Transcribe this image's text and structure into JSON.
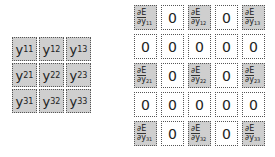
{
  "left_matrix": {
    "label": "Y",
    "cells": [
      [
        "y",
        "11"
      ],
      [
        "y",
        "12"
      ],
      [
        "y",
        "13"
      ],
      [
        "y",
        "21"
      ],
      [
        "y",
        "22"
      ],
      [
        "y",
        "23"
      ],
      [
        "y",
        "31"
      ],
      [
        "y",
        "32"
      ],
      [
        "y",
        "33"
      ]
    ]
  },
  "right_matrix": {
    "numerator": "∂E",
    "denominator": "∂y",
    "zero": "0",
    "rows": [
      [
        "11",
        "0",
        "12",
        "0",
        "13"
      ],
      [
        "0",
        "0",
        "0",
        "0",
        "0"
      ],
      [
        "21",
        "0",
        "22",
        "0",
        "23"
      ],
      [
        "0",
        "0",
        "0",
        "0",
        "0"
      ],
      [
        "31",
        "0",
        "32",
        "0",
        "33"
      ]
    ]
  },
  "colors": {
    "filled": "#cfcfcf",
    "empty": "#ffffff",
    "border": "#555555"
  }
}
